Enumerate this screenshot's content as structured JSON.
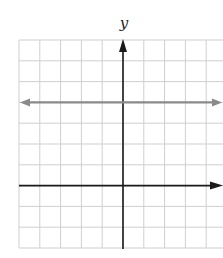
{
  "chart_data": {
    "type": "line",
    "title": "",
    "xlabel": "",
    "ylabel": "y",
    "grid": true,
    "xlim": [
      -5,
      5
    ],
    "ylim": [
      -3,
      7
    ],
    "tick_labels_shown": false,
    "axes": {
      "x_axis_arrow": "right",
      "y_axis_arrow": "up"
    },
    "series": [
      {
        "name": "horizontal line y = 4",
        "equation": "y = 4",
        "x": [
          -5,
          5
        ],
        "values": [
          4,
          4
        ],
        "color": "#8a8a8a",
        "arrows": "both"
      }
    ]
  },
  "layout": {
    "grid_origin_px": {
      "x": 19,
      "y": 40
    },
    "cell_px": 20.8,
    "cols": 10,
    "rows": 10,
    "axis_col": 5,
    "axis_row": 7,
    "colors": {
      "grid": "#cfcfcf",
      "axis": "#1a1a1a",
      "line": "#8a8a8a"
    }
  },
  "labels": {
    "y_axis": "y"
  }
}
